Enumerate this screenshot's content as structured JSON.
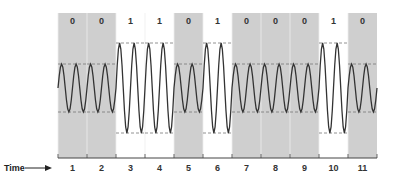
{
  "diagram": {
    "type": "amplitude-shift-keying",
    "bits": [
      "0",
      "0",
      "1",
      "1",
      "0",
      "1",
      "0",
      "0",
      "0",
      "1",
      "0"
    ],
    "time_slots": [
      "1",
      "2",
      "3",
      "4",
      "5",
      "6",
      "7",
      "8",
      "9",
      "10",
      "11"
    ],
    "axis_label": "Time",
    "colors": {
      "zero_band": "#cfcfcf",
      "one_band": "#ffffff",
      "wave": "#333333",
      "dashed": "#777777",
      "axis": "#444444"
    },
    "cycles_per_slot": 2,
    "amplitudes": {
      "0": "low",
      "1": "high"
    }
  }
}
